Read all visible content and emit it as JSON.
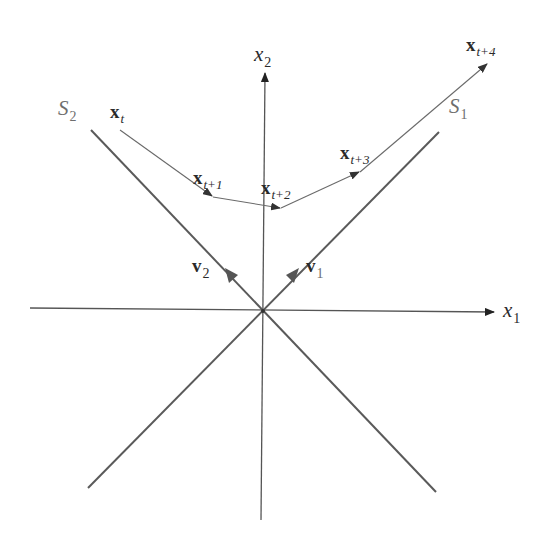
{
  "diagram": {
    "type": "vector-space-trajectory",
    "colors": {
      "background": "#ffffff",
      "axes": "#555555",
      "subspace_lines": "#5a5a5a",
      "trajectory": "#6a6a6a",
      "label_dark": "#2a2a2a",
      "label_gray": "#6e6e6e"
    },
    "axes": {
      "x1": {
        "name": "x",
        "sub": "1"
      },
      "x2": {
        "name": "x",
        "sub": "2"
      }
    },
    "subspaces": {
      "S1": {
        "name": "S",
        "sub": "1"
      },
      "S2": {
        "name": "S",
        "sub": "2"
      }
    },
    "vectors": {
      "v1": {
        "name": "v",
        "sub": "1"
      },
      "v2": {
        "name": "v",
        "sub": "2"
      }
    },
    "trajectory": [
      {
        "name": "x",
        "sub": "t"
      },
      {
        "name": "x",
        "sub": "t+1"
      },
      {
        "name": "x",
        "sub": "t+2"
      },
      {
        "name": "x",
        "sub": "t+3"
      },
      {
        "name": "x",
        "sub": "t+4"
      }
    ]
  }
}
